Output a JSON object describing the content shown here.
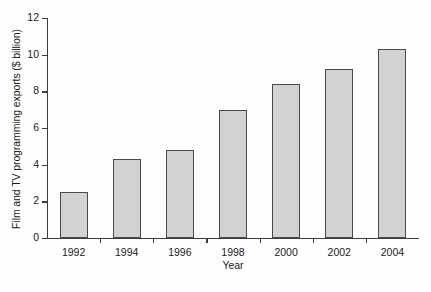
{
  "chart_data": {
    "type": "bar",
    "title": "",
    "subtitle": "",
    "xlabel": "Year",
    "ylabel": "Film and TV programming exports ($ billion)",
    "categories": [
      "1992",
      "1994",
      "1996",
      "1998",
      "2000",
      "2002",
      "2004"
    ],
    "values": [
      2.5,
      4.3,
      4.8,
      7.0,
      8.4,
      9.2,
      10.3
    ],
    "ylim": [
      0,
      12
    ],
    "ytick_labels": [
      "0",
      "2",
      "4",
      "6",
      "8",
      "10",
      "12"
    ],
    "ytick_values": [
      0,
      2,
      4,
      6,
      8,
      10,
      12
    ],
    "grid": false,
    "legend": false,
    "legend_position": "none",
    "annotations": [],
    "bar_fill_color": "#d2d2d2",
    "bar_edge_color": "#4a4a4a",
    "axis_color": "#3c3c3c",
    "background_color": "#ffffff"
  }
}
